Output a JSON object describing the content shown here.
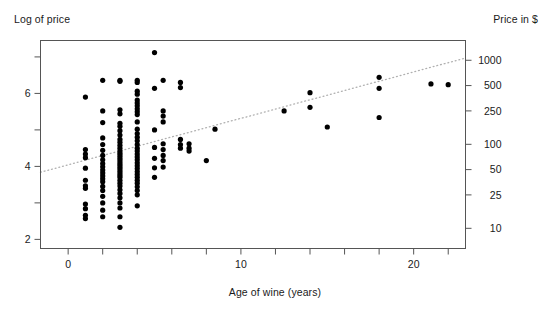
{
  "chart_data": {
    "type": "scatter",
    "title": "",
    "xlabel": "Age of wine (years)",
    "ylabel": "Log of price",
    "ylabel_right": "Price in $",
    "xlim": [
      -1.6,
      23.0
    ],
    "ylim": [
      1.75,
      7.45
    ],
    "grid": false,
    "legend": null,
    "xticks": [
      0,
      10,
      20
    ],
    "xticklabels": [
      "0",
      "10",
      "20"
    ],
    "xminorticks": [
      2,
      4,
      6,
      8,
      12,
      14,
      16,
      18,
      22
    ],
    "yticks": [
      2,
      4,
      6
    ],
    "yticklabels": [
      "2",
      "4",
      "6"
    ],
    "yminorticks": [
      3,
      5,
      7
    ],
    "right_axis": {
      "values": [
        10,
        25,
        50,
        100,
        250,
        500,
        1000
      ],
      "labels": [
        "10",
        "25",
        "50",
        "100",
        "250",
        "500",
        "1000"
      ],
      "log_positions": [
        2.303,
        3.219,
        3.912,
        4.605,
        5.521,
        6.215,
        6.908
      ]
    },
    "trendline": {
      "style": "dotted",
      "color": "#b0b0b0",
      "x": [
        -1.6,
        23.0
      ],
      "y": [
        3.84,
        6.97
      ]
    },
    "marker": {
      "shape": "circle",
      "color": "#000000",
      "size": 2.6
    },
    "points": [
      [
        1.0,
        5.9
      ],
      [
        1.0,
        4.46
      ],
      [
        1.0,
        4.34
      ],
      [
        1.0,
        4.24
      ],
      [
        1.0,
        3.95
      ],
      [
        1.0,
        3.62
      ],
      [
        1.0,
        3.47
      ],
      [
        1.0,
        3.4
      ],
      [
        1.0,
        2.97
      ],
      [
        1.0,
        2.84
      ],
      [
        1.0,
        2.66
      ],
      [
        1.0,
        2.57
      ],
      [
        2.0,
        6.36
      ],
      [
        2.0,
        5.52
      ],
      [
        2.0,
        5.2
      ],
      [
        2.0,
        4.78
      ],
      [
        2.0,
        4.6
      ],
      [
        2.0,
        4.44
      ],
      [
        2.0,
        4.3
      ],
      [
        2.0,
        4.18
      ],
      [
        2.0,
        4.08
      ],
      [
        2.0,
        3.99
      ],
      [
        2.0,
        3.9
      ],
      [
        2.0,
        3.82
      ],
      [
        2.0,
        3.74
      ],
      [
        2.0,
        3.66
      ],
      [
        2.0,
        3.58
      ],
      [
        2.0,
        3.45
      ],
      [
        2.0,
        3.34
      ],
      [
        2.0,
        3.18
      ],
      [
        2.0,
        3.0
      ],
      [
        2.0,
        2.8
      ],
      [
        2.0,
        2.62
      ],
      [
        3.0,
        6.36
      ],
      [
        3.0,
        6.33
      ],
      [
        3.0,
        5.55
      ],
      [
        3.0,
        5.44
      ],
      [
        3.0,
        5.18
      ],
      [
        3.0,
        5.1
      ],
      [
        3.0,
        4.98
      ],
      [
        3.0,
        4.86
      ],
      [
        3.0,
        4.74
      ],
      [
        3.0,
        4.66
      ],
      [
        3.0,
        4.58
      ],
      [
        3.0,
        4.5
      ],
      [
        3.0,
        4.42
      ],
      [
        3.0,
        4.36
      ],
      [
        3.0,
        4.3
      ],
      [
        3.0,
        4.24
      ],
      [
        3.0,
        4.18
      ],
      [
        3.0,
        4.12
      ],
      [
        3.0,
        4.06
      ],
      [
        3.0,
        4.0
      ],
      [
        3.0,
        3.94
      ],
      [
        3.0,
        3.88
      ],
      [
        3.0,
        3.82
      ],
      [
        3.0,
        3.76
      ],
      [
        3.0,
        3.7
      ],
      [
        3.0,
        3.62
      ],
      [
        3.0,
        3.54
      ],
      [
        3.0,
        3.46
      ],
      [
        3.0,
        3.36
      ],
      [
        3.0,
        3.26
      ],
      [
        3.0,
        3.14
      ],
      [
        3.0,
        3.0
      ],
      [
        3.0,
        2.86
      ],
      [
        3.0,
        2.62
      ],
      [
        3.0,
        2.33
      ],
      [
        4.0,
        6.36
      ],
      [
        4.0,
        6.3
      ],
      [
        4.0,
        6.06
      ],
      [
        4.0,
        5.98
      ],
      [
        4.0,
        5.82
      ],
      [
        4.0,
        5.74
      ],
      [
        4.0,
        5.66
      ],
      [
        4.0,
        5.58
      ],
      [
        4.0,
        5.5
      ],
      [
        4.0,
        5.42
      ],
      [
        4.0,
        5.22
      ],
      [
        4.0,
        5.02
      ],
      [
        4.0,
        4.9
      ],
      [
        4.0,
        4.8
      ],
      [
        4.0,
        4.7
      ],
      [
        4.0,
        4.6
      ],
      [
        4.0,
        4.5
      ],
      [
        4.0,
        4.42
      ],
      [
        4.0,
        4.34
      ],
      [
        4.0,
        4.26
      ],
      [
        4.0,
        4.18
      ],
      [
        4.0,
        4.1
      ],
      [
        4.0,
        4.02
      ],
      [
        4.0,
        3.94
      ],
      [
        4.0,
        3.86
      ],
      [
        4.0,
        3.78
      ],
      [
        4.0,
        3.7
      ],
      [
        4.0,
        3.62
      ],
      [
        4.0,
        3.54
      ],
      [
        4.0,
        3.44
      ],
      [
        4.0,
        3.34
      ],
      [
        4.0,
        3.22
      ],
      [
        4.0,
        2.92
      ],
      [
        5.0,
        7.12
      ],
      [
        5.0,
        6.14
      ],
      [
        5.0,
        5.0
      ],
      [
        5.0,
        4.52
      ],
      [
        5.0,
        4.22
      ],
      [
        5.0,
        3.96
      ],
      [
        5.0,
        3.7
      ],
      [
        5.5,
        6.36
      ],
      [
        5.5,
        5.52
      ],
      [
        5.5,
        5.38
      ],
      [
        5.5,
        5.22
      ],
      [
        5.5,
        4.62
      ],
      [
        5.5,
        4.46
      ],
      [
        5.5,
        4.3
      ],
      [
        5.5,
        4.16
      ],
      [
        5.5,
        3.98
      ],
      [
        6.5,
        6.3
      ],
      [
        6.5,
        6.16
      ],
      [
        6.5,
        4.74
      ],
      [
        6.5,
        4.6
      ],
      [
        6.5,
        4.5
      ],
      [
        7.0,
        4.62
      ],
      [
        7.0,
        4.5
      ],
      [
        7.0,
        4.42
      ],
      [
        8.0,
        4.16
      ],
      [
        8.5,
        5.02
      ],
      [
        12.5,
        5.52
      ],
      [
        14.0,
        6.02
      ],
      [
        14.0,
        5.62
      ],
      [
        15.0,
        5.08
      ],
      [
        18.0,
        6.44
      ],
      [
        18.0,
        6.14
      ],
      [
        18.0,
        5.34
      ],
      [
        21.0,
        6.26
      ],
      [
        22.0,
        6.24
      ]
    ]
  },
  "axes": {
    "left_title": "Log of price",
    "right_title": "Price in $",
    "bottom_title": "Age of wine (years)"
  },
  "style": {
    "frame_color": "#555555",
    "point_color": "#000000",
    "trend_color": "#b4b4b4",
    "text_color": "#1a1a1a",
    "background": "#ffffff"
  }
}
